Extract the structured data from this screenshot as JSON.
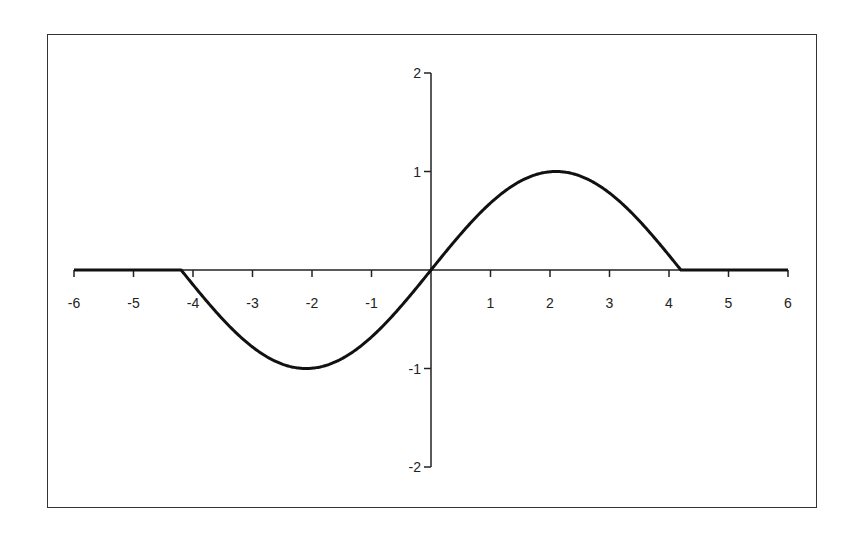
{
  "chart_data": {
    "type": "line",
    "title": "",
    "xlabel": "",
    "ylabel": "",
    "xlim": [
      -6,
      6
    ],
    "ylim": [
      -2,
      2
    ],
    "grid": false,
    "legend": null,
    "x_ticks": [
      "-6",
      "-5",
      "-4",
      "-3",
      "-2",
      "-1",
      "1",
      "2",
      "3",
      "4",
      "5",
      "6"
    ],
    "y_ticks": [
      "2",
      "1",
      "-1",
      "-2"
    ],
    "series": [
      {
        "name": "f(x)",
        "description": "sin(pi*x/4.2) for |x| <= 4.2, 0 otherwise",
        "color": "#111111",
        "x": [
          -6,
          -5,
          -4.2,
          -4,
          -3.5,
          -3,
          -2.5,
          -2.1,
          -1.5,
          -1,
          -0.5,
          0,
          0.5,
          1,
          1.5,
          2.1,
          2.5,
          3,
          3.5,
          4,
          4.2,
          5,
          6
        ],
        "y": [
          0,
          0,
          0,
          -0.15,
          -0.5,
          -0.78,
          -0.95,
          -1.0,
          -0.78,
          -0.68,
          -0.37,
          0,
          0.37,
          0.68,
          0.78,
          1.0,
          0.95,
          0.78,
          0.5,
          0.15,
          0,
          0,
          0
        ]
      }
    ]
  },
  "axes": {
    "x_tick_values": [
      -6,
      -5,
      -4,
      -3,
      -2,
      -1,
      1,
      2,
      3,
      4,
      5,
      6
    ],
    "y_tick_values": [
      2,
      1,
      -1,
      -2
    ]
  }
}
